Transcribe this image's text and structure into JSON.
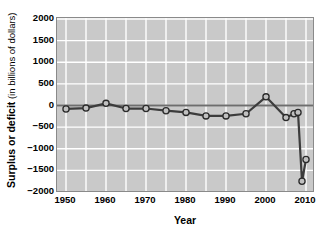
{
  "chart_data": {
    "type": "line",
    "title": "",
    "xlabel": "Year",
    "ylabel_bold": "Surplus or deficit",
    "ylabel_regular": " (in billions of dollars)",
    "xlim": [
      1948,
      2012
    ],
    "ylim": [
      -2000,
      2000
    ],
    "xticks": [
      1950,
      1960,
      1970,
      1980,
      1990,
      2000,
      2010
    ],
    "yticks": [
      2000,
      1500,
      1000,
      500,
      0,
      -500,
      -1000,
      -1500,
      -2000
    ],
    "ytick_labels": [
      "2000",
      "1500",
      "1000",
      "500",
      "0",
      "−500",
      "−1000",
      "−1500",
      "−2000"
    ],
    "xtick_labels": [
      "1950",
      "1960",
      "1970",
      "1980",
      "1990",
      "2000",
      "2010"
    ],
    "x_minor_step": 5,
    "y_minor_step": 500,
    "grid": true,
    "grid_color": "#ffffff",
    "plot_background": "#c9c9c9",
    "line_color": "#3c3c3c",
    "marker_face_color": "#c0c0c0",
    "marker_edge_color": "#2a2a2a",
    "zero_line": true,
    "zero_line_color": "#6e6e6e",
    "legend": "none",
    "x": [
      1950,
      1955,
      1960,
      1965,
      1970,
      1975,
      1980,
      1985,
      1990,
      1995,
      2000,
      2005,
      2007,
      2008,
      2009,
      2010
    ],
    "values": [
      -80,
      -60,
      50,
      -70,
      -70,
      -120,
      -160,
      -240,
      -240,
      -190,
      200,
      -280,
      -190,
      -160,
      -1750,
      -1250
    ],
    "series": [
      {
        "name": "Surplus or deficit",
        "values": [
          -80,
          -60,
          50,
          -70,
          -70,
          -120,
          -160,
          -240,
          -240,
          -190,
          200,
          -280,
          -190,
          -160,
          -1750,
          -1250
        ]
      }
    ]
  }
}
